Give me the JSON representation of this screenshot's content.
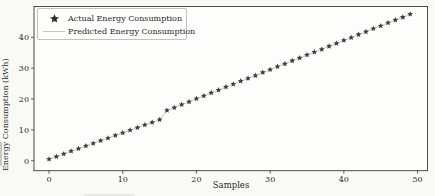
{
  "figure": {
    "background": "#f9f9f6",
    "plot_background": "#fdfdfc",
    "frame_color": "#3a3a3a",
    "tick_color": "#3a3a3a",
    "text_color": "#2b2b2b"
  },
  "chart_data": {
    "type": "line",
    "title": "",
    "xlabel": "Samples",
    "ylabel": "Energy Consumption (kWh)",
    "xlim": [
      -2.04,
      51.35
    ],
    "ylim": [
      -3.24,
      49.98
    ],
    "x_ticks": [
      0,
      10,
      20,
      30,
      40,
      50
    ],
    "y_ticks": [
      0,
      10,
      20,
      30,
      40
    ],
    "grid": false,
    "legend": {
      "position": "upper left"
    },
    "x": [
      0,
      1,
      2,
      3,
      4,
      5,
      6,
      7,
      8,
      9,
      10,
      11,
      12,
      13,
      14,
      15,
      16,
      17,
      18,
      19,
      20,
      21,
      22,
      23,
      24,
      25,
      26,
      27,
      28,
      29,
      30,
      31,
      32,
      33,
      34,
      35,
      36,
      37,
      38,
      39,
      40,
      41,
      42,
      43,
      44,
      45,
      46,
      47,
      48,
      49
    ],
    "series": [
      {
        "name": "Actual Energy Consumption",
        "type": "scatter",
        "marker": "star",
        "color": "#3f3f3f",
        "values": [
          0.5,
          1.3,
          2.2,
          3.1,
          3.9,
          4.8,
          5.6,
          6.5,
          7.3,
          8.2,
          9.0,
          9.9,
          10.7,
          11.6,
          12.4,
          13.3,
          16.3,
          17.2,
          18.2,
          19.1,
          20.1,
          21.0,
          22.0,
          22.9,
          23.9,
          24.8,
          25.8,
          26.7,
          27.6,
          28.6,
          29.5,
          30.5,
          31.4,
          32.4,
          33.3,
          34.3,
          35.2,
          36.1,
          37.1,
          38.0,
          39.0,
          39.9,
          40.9,
          41.8,
          42.8,
          43.7,
          44.7,
          45.6,
          46.5,
          47.5
        ]
      },
      {
        "name": "Predicted Energy Consumption",
        "type": "line",
        "marker": "none",
        "color": "#c7c7bf",
        "values": [
          0.5,
          1.3,
          2.2,
          3.1,
          3.9,
          4.8,
          5.6,
          6.5,
          7.3,
          8.2,
          9.0,
          9.9,
          10.7,
          11.6,
          12.4,
          13.3,
          16.3,
          17.2,
          18.2,
          19.1,
          20.1,
          21.0,
          22.0,
          22.9,
          23.9,
          24.8,
          25.8,
          26.7,
          27.6,
          28.6,
          29.5,
          30.5,
          31.4,
          32.4,
          33.3,
          34.3,
          35.2,
          36.1,
          37.1,
          38.0,
          39.0,
          39.9,
          40.9,
          41.8,
          42.8,
          43.7,
          44.7,
          45.6,
          46.5,
          47.5
        ]
      }
    ]
  }
}
